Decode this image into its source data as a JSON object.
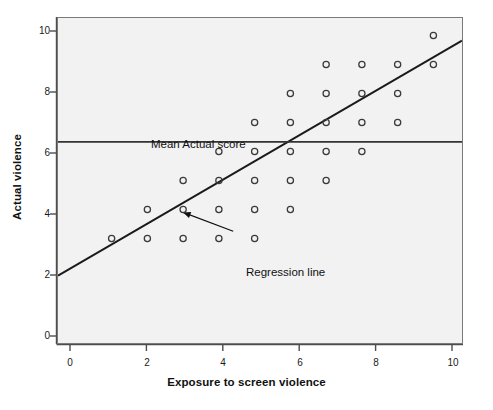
{
  "chart_data": {
    "type": "scatter",
    "title": "",
    "xlabel": "Exposure to screen violence",
    "ylabel": "Actual violence",
    "xlim": [
      -0.5,
      10.8
    ],
    "ylim": [
      -0.6,
      10.6
    ],
    "xticks": [
      0,
      2,
      4,
      6,
      8,
      10
    ],
    "xtick_labels": [
      "0",
      "2",
      "4",
      "6",
      "8",
      "10"
    ],
    "yticks": [
      0,
      2,
      4,
      6,
      8,
      10
    ],
    "ytick_labels": [
      "0",
      "2",
      "4",
      "6",
      "8",
      "10"
    ],
    "grid": false,
    "legend": "none",
    "marker": "open-circle",
    "points": [
      {
        "x": 1,
        "y": 3
      },
      {
        "x": 2,
        "y": 3
      },
      {
        "x": 2,
        "y": 4
      },
      {
        "x": 3,
        "y": 3
      },
      {
        "x": 3,
        "y": 4
      },
      {
        "x": 3,
        "y": 5
      },
      {
        "x": 4,
        "y": 3
      },
      {
        "x": 4,
        "y": 4
      },
      {
        "x": 4,
        "y": 5
      },
      {
        "x": 4,
        "y": 6
      },
      {
        "x": 5,
        "y": 3
      },
      {
        "x": 5,
        "y": 4
      },
      {
        "x": 5,
        "y": 5
      },
      {
        "x": 5,
        "y": 6
      },
      {
        "x": 5,
        "y": 7
      },
      {
        "x": 6,
        "y": 4
      },
      {
        "x": 6,
        "y": 5
      },
      {
        "x": 6,
        "y": 6
      },
      {
        "x": 6,
        "y": 7
      },
      {
        "x": 6,
        "y": 8
      },
      {
        "x": 7,
        "y": 5
      },
      {
        "x": 7,
        "y": 6
      },
      {
        "x": 7,
        "y": 7
      },
      {
        "x": 7,
        "y": 8
      },
      {
        "x": 7,
        "y": 9
      },
      {
        "x": 8,
        "y": 6
      },
      {
        "x": 8,
        "y": 7
      },
      {
        "x": 8,
        "y": 8
      },
      {
        "x": 8,
        "y": 9
      },
      {
        "x": 9,
        "y": 7
      },
      {
        "x": 9,
        "y": 8
      },
      {
        "x": 9,
        "y": 9
      },
      {
        "x": 10,
        "y": 9
      },
      {
        "x": 10,
        "y": 10
      }
    ],
    "reference_lines": [
      {
        "name": "mean-actual-score",
        "label": "Mean Actual score",
        "orientation": "horizontal",
        "value": 6.33,
        "color": "#333333"
      },
      {
        "name": "regression-line",
        "label": "Regression line",
        "orientation": "diagonal",
        "x_start": -0.5,
        "y_start": 1.72,
        "x_end": 10.8,
        "y_end": 9.82,
        "slope": 0.717,
        "intercept": 2.08,
        "color": "#1a1a1a"
      }
    ],
    "annotations": [
      {
        "name": "regression-line-callout",
        "text": "Regression line",
        "arrow_from_x": 4.4,
        "arrow_from_y": 3.25,
        "arrow_to_x": 3.0,
        "arrow_to_y": 3.9
      }
    ],
    "colors": {
      "panel_background": "#f2f2f2",
      "panel_border": "#7a7a7a",
      "marker_stroke": "#3a3a3a",
      "mean_line": "#333333",
      "regression_line": "#1a1a1a",
      "text": "#111111"
    }
  },
  "caption": ""
}
